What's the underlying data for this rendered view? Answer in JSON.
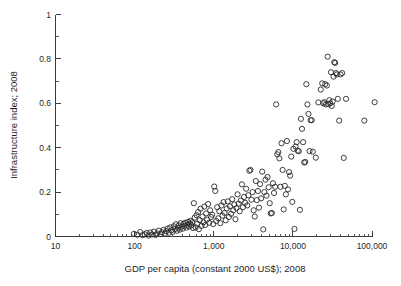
{
  "chart_data": {
    "type": "scatter",
    "title": "",
    "xlabel": "GDP per capita (constant 2000 US$); 2008",
    "ylabel": "Infrastructure index; 2008",
    "xscale": "log",
    "yscale": "linear",
    "xlim": [
      10,
      100000
    ],
    "ylim": [
      0,
      1
    ],
    "grid": false,
    "legend": null,
    "marker": "open-circle",
    "x_tick_labels": [
      "10",
      "100",
      "1,000",
      "10,000",
      "100,000"
    ],
    "x_tick_values": [
      10,
      100,
      1000,
      10000,
      100000
    ],
    "y_tick_labels": [
      "0",
      "0.2",
      "0.4",
      "0.6",
      "0.8",
      "1"
    ],
    "y_tick_values": [
      0,
      0.2,
      0.4,
      0.6,
      0.8,
      1
    ],
    "y_minor_ticks": [
      0.1,
      0.3,
      0.5,
      0.7,
      0.9
    ],
    "series": [
      {
        "name": "countries",
        "points": [
          [
            98,
            0.012
          ],
          [
            108,
            0.008
          ],
          [
            118,
            0.02
          ],
          [
            126,
            0.006
          ],
          [
            134,
            0.01
          ],
          [
            142,
            0.016
          ],
          [
            150,
            0.004
          ],
          [
            158,
            0.018
          ],
          [
            166,
            0.009
          ],
          [
            175,
            0.022
          ],
          [
            184,
            0.007
          ],
          [
            193,
            0.014
          ],
          [
            202,
            0.026
          ],
          [
            212,
            0.011
          ],
          [
            222,
            0.019
          ],
          [
            232,
            0.03
          ],
          [
            242,
            0.013
          ],
          [
            252,
            0.024
          ],
          [
            262,
            0.036
          ],
          [
            272,
            0.017
          ],
          [
            282,
            0.041
          ],
          [
            292,
            0.028
          ],
          [
            302,
            0.021
          ],
          [
            312,
            0.046
          ],
          [
            322,
            0.033
          ],
          [
            332,
            0.055
          ],
          [
            342,
            0.026
          ],
          [
            352,
            0.039
          ],
          [
            362,
            0.05
          ],
          [
            372,
            0.031
          ],
          [
            382,
            0.06
          ],
          [
            393,
            0.044
          ],
          [
            404,
            0.035
          ],
          [
            415,
            0.057
          ],
          [
            426,
            0.048
          ],
          [
            438,
            0.062
          ],
          [
            450,
            0.04
          ],
          [
            462,
            0.053
          ],
          [
            474,
            0.066
          ],
          [
            486,
            0.045
          ],
          [
            498,
            0.058
          ],
          [
            510,
            0.071
          ],
          [
            522,
            0.05
          ],
          [
            535,
            0.064
          ],
          [
            548,
            0.038
          ],
          [
            560,
            0.15
          ],
          [
            575,
            0.085
          ],
          [
            590,
            0.041
          ],
          [
            605,
            0.096
          ],
          [
            620,
            0.058
          ],
          [
            635,
            0.11
          ],
          [
            650,
            0.033
          ],
          [
            665,
            0.073
          ],
          [
            680,
            0.125
          ],
          [
            700,
            0.048
          ],
          [
            720,
            0.09
          ],
          [
            740,
            0.064
          ],
          [
            760,
            0.135
          ],
          [
            780,
            0.052
          ],
          [
            800,
            0.104
          ],
          [
            825,
            0.076
          ],
          [
            850,
            0.146
          ],
          [
            875,
            0.062
          ],
          [
            900,
            0.118
          ],
          [
            925,
            0.088
          ],
          [
            955,
            0.098
          ],
          [
            985,
            0.056
          ],
          [
            1015,
            0.225
          ],
          [
            1045,
            0.205
          ],
          [
            1075,
            0.07
          ],
          [
            1105,
            0.132
          ],
          [
            1140,
            0.082
          ],
          [
            1175,
            0.114
          ],
          [
            1210,
            0.06
          ],
          [
            1250,
            0.14
          ],
          [
            1290,
            0.094
          ],
          [
            1330,
            0.155
          ],
          [
            1370,
            0.106
          ],
          [
            1415,
            0.073
          ],
          [
            1460,
            0.126
          ],
          [
            1505,
            0.158
          ],
          [
            1555,
            0.088
          ],
          [
            1605,
            0.136
          ],
          [
            1655,
            0.102
          ],
          [
            1710,
            0.168
          ],
          [
            1765,
            0.118
          ],
          [
            1820,
            0.144
          ],
          [
            1880,
            0.078
          ],
          [
            1940,
            0.128
          ],
          [
            2000,
            0.19
          ],
          [
            2065,
            0.148
          ],
          [
            2130,
            0.114
          ],
          [
            2200,
            0.162
          ],
          [
            2270,
            0.235
          ],
          [
            2340,
            0.132
          ],
          [
            2415,
            0.178
          ],
          [
            2490,
            0.152
          ],
          [
            2570,
            0.215
          ],
          [
            2650,
            0.14
          ],
          [
            2735,
            0.186
          ],
          [
            2820,
            0.296
          ],
          [
            2910,
            0.3
          ],
          [
            3000,
            0.166
          ],
          [
            3095,
            0.2
          ],
          [
            3195,
            0.118
          ],
          [
            3295,
            0.09
          ],
          [
            3400,
            0.25
          ],
          [
            3505,
            0.164
          ],
          [
            3615,
            0.205
          ],
          [
            3730,
            0.13
          ],
          [
            3850,
            0.236
          ],
          [
            3970,
            0.172
          ],
          [
            4095,
            0.292
          ],
          [
            4225,
            0.032
          ],
          [
            4360,
            0.2
          ],
          [
            4500,
            0.256
          ],
          [
            4640,
            0.184
          ],
          [
            4790,
            0.268
          ],
          [
            4940,
            0.222
          ],
          [
            5095,
            0.15
          ],
          [
            5260,
            0.104
          ],
          [
            5425,
            0.106
          ],
          [
            5600,
            0.24
          ],
          [
            5775,
            0.196
          ],
          [
            5960,
            0.224
          ],
          [
            6150,
            0.595
          ],
          [
            6345,
            0.37
          ],
          [
            6545,
            0.38
          ],
          [
            6755,
            0.352
          ],
          [
            6970,
            0.224
          ],
          [
            7190,
            0.42
          ],
          [
            7420,
            0.3
          ],
          [
            7655,
            0.122
          ],
          [
            7900,
            0.228
          ],
          [
            8150,
            0.19
          ],
          [
            8410,
            0.43
          ],
          [
            8680,
            0.212
          ],
          [
            8955,
            0.29
          ],
          [
            9240,
            0.274
          ],
          [
            9535,
            0.36
          ],
          [
            9840,
            0.156
          ],
          [
            10150,
            0.395
          ],
          [
            10475,
            0.034
          ],
          [
            10810,
            0.405
          ],
          [
            11155,
            0.425
          ],
          [
            11510,
            0.387
          ],
          [
            11880,
            0.384
          ],
          [
            12260,
            0.12
          ],
          [
            12650,
            0.53
          ],
          [
            13050,
            0.485
          ],
          [
            13465,
            0.425
          ],
          [
            13895,
            0.333
          ],
          [
            14335,
            0.336
          ],
          [
            14790,
            0.686
          ],
          [
            15265,
            0.595
          ],
          [
            15750,
            0.552
          ],
          [
            16250,
            0.385
          ],
          [
            16765,
            0.524
          ],
          [
            17300,
            0.524
          ],
          [
            17855,
            0.382
          ],
          [
            19500,
            0.355
          ],
          [
            21000,
            0.604
          ],
          [
            22500,
            0.662
          ],
          [
            23500,
            0.69
          ],
          [
            24200,
            0.6
          ],
          [
            24900,
            0.605
          ],
          [
            25600,
            0.686
          ],
          [
            26200,
            0.595
          ],
          [
            26900,
            0.68
          ],
          [
            27500,
            0.81
          ],
          [
            28200,
            0.596
          ],
          [
            28900,
            0.614
          ],
          [
            29600,
            0.6
          ],
          [
            30300,
            0.74
          ],
          [
            31000,
            0.588
          ],
          [
            31800,
            0.608
          ],
          [
            32600,
            0.72
          ],
          [
            33400,
            0.785
          ],
          [
            34200,
            0.782
          ],
          [
            35000,
            0.736
          ],
          [
            35900,
            0.73
          ],
          [
            37000,
            0.62
          ],
          [
            38500,
            0.522
          ],
          [
            40000,
            0.73
          ],
          [
            42000,
            0.736
          ],
          [
            44000,
            0.354
          ],
          [
            47000,
            0.62
          ],
          [
            80000,
            0.522
          ],
          [
            108000,
            0.605
          ]
        ]
      }
    ]
  },
  "figure": {
    "marker_radius_px": 2.6,
    "axis_color": "#3b3b3b",
    "marker_color": "#2a2a2a",
    "background": "#ffffff"
  }
}
